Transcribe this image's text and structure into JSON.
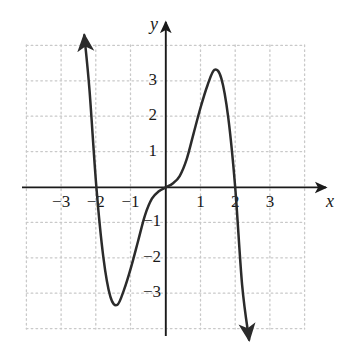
{
  "figure": {
    "name": "cubic-function-graph",
    "background_color": "#ffffff",
    "axis_color": "#1a1a1a",
    "grid_color": "#c9c9c9",
    "curve_color": "#2b2b2b"
  },
  "chart_data": {
    "type": "line",
    "title": "",
    "subtitle": "",
    "xlabel": "x",
    "ylabel": "y",
    "xlim": [
      -4,
      4
    ],
    "ylim": [
      -4,
      4
    ],
    "grid": true,
    "grid_style": "dotted",
    "grid_spacing": 1,
    "legend": false,
    "legend_position": "none",
    "xticks": [
      -3,
      -2,
      -1,
      1,
      2,
      3
    ],
    "xtick_labels": [
      "−3",
      "−2",
      "−1",
      "1",
      "2",
      "3"
    ],
    "yticks": [
      3,
      2,
      1,
      -1,
      -2,
      -3
    ],
    "ytick_labels": [
      "3",
      "2",
      "1",
      "−1",
      "−2",
      "−3"
    ],
    "axis_arrows": [
      "x-positive",
      "y-positive"
    ],
    "series": [
      {
        "name": "curve",
        "style": "solid",
        "arrow_start": "up-left",
        "arrow_end": "down-right",
        "roots": [
          -2,
          0,
          2
        ],
        "local_min": {
          "x": -1.18,
          "y": -3.05
        },
        "local_max": {
          "x": 1.18,
          "y": 3.05
        },
        "x": [
          -2.35,
          -2.2,
          -2.0,
          -1.8,
          -1.6,
          -1.4,
          -1.2,
          -1.0,
          -0.8,
          -0.6,
          -0.4,
          -0.2,
          0.0,
          0.2,
          0.4,
          0.6,
          0.8,
          1.0,
          1.2,
          1.4,
          1.6,
          1.8,
          2.0,
          2.2,
          2.4
        ],
        "y": [
          4.3,
          2.76,
          0.0,
          -1.97,
          -3.08,
          -3.32,
          -2.88,
          -2.25,
          -1.52,
          -0.79,
          -0.32,
          -0.11,
          0.0,
          0.11,
          0.32,
          0.79,
          1.52,
          2.25,
          2.88,
          3.32,
          3.08,
          1.97,
          0.0,
          -2.76,
          -4.3
        ]
      }
    ]
  },
  "labels": {
    "x_axis": "x",
    "y_axis": "y",
    "x_minus3": "−3",
    "x_minus2": "−2",
    "x_minus1": "−1",
    "x_1": "1",
    "x_2": "2",
    "x_3": "3",
    "y_3": "3",
    "y_2": "2",
    "y_1": "1",
    "y_minus1": "−1",
    "y_minus2": "−2",
    "y_minus3": "−3"
  }
}
